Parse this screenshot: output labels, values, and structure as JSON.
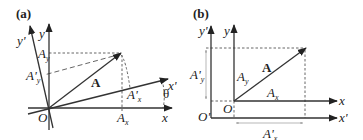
{
  "panels": [
    {
      "label": "(a)",
      "origin": "O",
      "x_axis": "x",
      "y_axis": "y",
      "x_prime_axis": "x'",
      "y_prime_axis": "y'",
      "vector": "A",
      "components": {
        "Ax": "A",
        "Ax_sub": "x",
        "Ay": "A",
        "Ay_sub": "y",
        "Apx": "A'",
        "Apx_sub": "x",
        "Apy": "A'",
        "Apy_sub": "y"
      },
      "angle": "θ"
    },
    {
      "label": "(b)",
      "origin": "O",
      "origin_prime": "O'",
      "x_axis": "x",
      "y_axis": "y",
      "x_prime_axis": "x'",
      "y_prime_axis": "y'",
      "vector": "A",
      "components": {
        "Ax": "A",
        "Ax_sub": "x",
        "Ay": "A",
        "Ay_sub": "y",
        "Apx": "A'",
        "Apx_sub": "x",
        "Apy": "A'",
        "Apy_sub": "y"
      }
    }
  ]
}
